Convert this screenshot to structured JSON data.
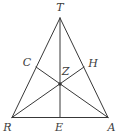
{
  "figure": {
    "background_color": "#ffffff",
    "line_color": "#383838",
    "label_color": "#3d3d3d",
    "line_width": 1,
    "dot_radius": 1.8,
    "points": {
      "T": {
        "x": 60,
        "y": 18,
        "label": "T",
        "lx": 60,
        "ly": 7.5
      },
      "R": {
        "x": 12,
        "y": 117.5,
        "label": "R",
        "lx": 7.5,
        "ly": 127
      },
      "A": {
        "x": 108,
        "y": 117.5,
        "label": "A",
        "lx": 111.5,
        "ly": 127
      },
      "E": {
        "x": 60,
        "y": 117.5,
        "label": "E",
        "lx": 59,
        "ly": 127.5
      },
      "C": {
        "x": 36,
        "y": 67,
        "label": "C",
        "lx": 27,
        "ly": 62
      },
      "H": {
        "x": 84,
        "y": 67,
        "label": "H",
        "lx": 93,
        "ly": 63
      },
      "Z": {
        "x": 60,
        "y": 84,
        "label": "Z",
        "lx": 65.5,
        "ly": 71
      }
    },
    "segments": [
      {
        "from": "T",
        "to": "R",
        "kind": "side"
      },
      {
        "from": "T",
        "to": "A",
        "kind": "side"
      },
      {
        "from": "R",
        "to": "A",
        "kind": "side"
      },
      {
        "from": "T",
        "to": "E",
        "kind": "median"
      },
      {
        "from": "A",
        "to": "C",
        "kind": "median"
      },
      {
        "from": "R",
        "to": "H",
        "kind": "median"
      }
    ],
    "dot_at": "Z"
  }
}
